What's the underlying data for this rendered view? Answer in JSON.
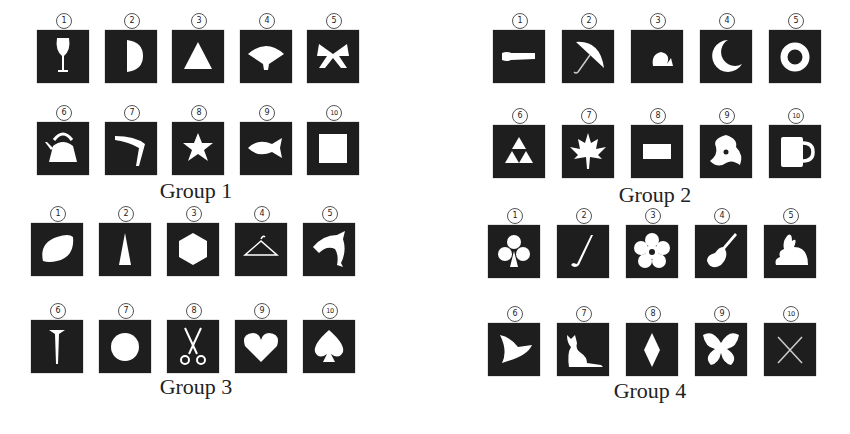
{
  "groups": [
    {
      "label": "Group 1",
      "items": [
        {
          "num": "1",
          "icon": "wine-glass"
        },
        {
          "num": "2",
          "icon": "half-circle"
        },
        {
          "num": "3",
          "icon": "triangle"
        },
        {
          "num": "4",
          "icon": "folding-fan"
        },
        {
          "num": "5",
          "icon": "ribbon-bow"
        },
        {
          "num": "6",
          "icon": "kettle"
        },
        {
          "num": "7",
          "icon": "boomerang"
        },
        {
          "num": "8",
          "icon": "star"
        },
        {
          "num": "9",
          "icon": "fish"
        },
        {
          "num": "10",
          "icon": "square"
        }
      ]
    },
    {
      "label": "Group 2",
      "items": [
        {
          "num": "1",
          "icon": "baseball-bat"
        },
        {
          "num": "2",
          "icon": "umbrella"
        },
        {
          "num": "3",
          "icon": "snail"
        },
        {
          "num": "4",
          "icon": "crescent-moon"
        },
        {
          "num": "5",
          "icon": "ring"
        },
        {
          "num": "6",
          "icon": "triforce"
        },
        {
          "num": "7",
          "icon": "maple-leaf"
        },
        {
          "num": "8",
          "icon": "rectangle"
        },
        {
          "num": "9",
          "icon": "shuriken"
        },
        {
          "num": "10",
          "icon": "mug"
        }
      ]
    },
    {
      "label": "Group 3",
      "items": [
        {
          "num": "1",
          "icon": "lemon"
        },
        {
          "num": "2",
          "icon": "tall-triangle"
        },
        {
          "num": "3",
          "icon": "hexagon"
        },
        {
          "num": "4",
          "icon": "clothes-hanger"
        },
        {
          "num": "5",
          "icon": "dolphin"
        },
        {
          "num": "6",
          "icon": "nail"
        },
        {
          "num": "7",
          "icon": "circle"
        },
        {
          "num": "8",
          "icon": "scissors"
        },
        {
          "num": "9",
          "icon": "heart"
        },
        {
          "num": "10",
          "icon": "spade"
        }
      ]
    },
    {
      "label": "Group 4",
      "items": [
        {
          "num": "1",
          "icon": "club"
        },
        {
          "num": "2",
          "icon": "golf-club"
        },
        {
          "num": "3",
          "icon": "flower"
        },
        {
          "num": "4",
          "icon": "guitar"
        },
        {
          "num": "5",
          "icon": "rabbit"
        },
        {
          "num": "6",
          "icon": "witch-hat"
        },
        {
          "num": "7",
          "icon": "cat"
        },
        {
          "num": "8",
          "icon": "diamond"
        },
        {
          "num": "9",
          "icon": "butterfly"
        },
        {
          "num": "10",
          "icon": "x-cross"
        }
      ]
    }
  ],
  "colors": {
    "tile": "#1e1e1e",
    "glyph": "#ffffff",
    "text": "#222222"
  }
}
